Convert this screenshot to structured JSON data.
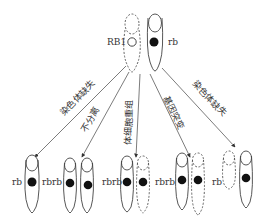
{
  "diagram": {
    "type": "chromosome-loss-of-heterozygosity",
    "top": {
      "left_label": "RB1",
      "right_label": "rb",
      "left_chromosome": "dashed, hollow allele",
      "right_chromosome": "solid, filled allele"
    },
    "mechanisms": [
      {
        "label": "染色体缺失"
      },
      {
        "label": "不分离"
      },
      {
        "label": "体细胞重组"
      },
      {
        "label": "基因突变"
      },
      {
        "label": "染色体缺失"
      }
    ],
    "outcomes": [
      {
        "label": "rb"
      },
      {
        "label": "rbrb"
      },
      {
        "label": "rbrb"
      },
      {
        "label": "rbrb"
      },
      {
        "label": "rb"
      }
    ],
    "colors": {
      "line": "#444444",
      "allele_fill": "#111111",
      "text": "#333333"
    }
  }
}
